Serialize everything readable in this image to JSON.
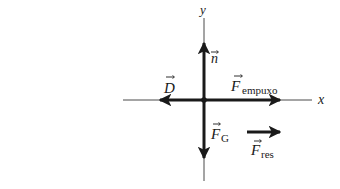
{
  "diagram": {
    "type": "free-body-diagram",
    "colors": {
      "ink": "#1a1a1a",
      "axis": "#4a4a4a",
      "background": "#ffffff"
    },
    "axes": {
      "x_label": "x",
      "y_label": "y"
    },
    "forces": [
      {
        "id": "n",
        "symbol": "n",
        "subscript": "",
        "direction": "up"
      },
      {
        "id": "D",
        "symbol": "D",
        "subscript": "",
        "direction": "left"
      },
      {
        "id": "F_empuxo",
        "symbol": "F",
        "subscript": "empuxo",
        "direction": "right"
      },
      {
        "id": "F_G",
        "symbol": "F",
        "subscript": "G",
        "direction": "down"
      }
    ],
    "resultant": {
      "id": "F_res",
      "symbol": "F",
      "subscript": "res",
      "direction": "right"
    }
  }
}
